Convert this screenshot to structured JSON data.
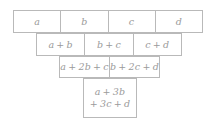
{
  "diagram": {
    "style": {
      "border_color": "#b9b9b9",
      "text_color": "#9a9a9a",
      "background_color": "#ffffff"
    },
    "rows": [
      {
        "name": "row-1-variables",
        "cells": [
          {
            "label": "a"
          },
          {
            "label": "b"
          },
          {
            "label": "c"
          },
          {
            "label": "d"
          }
        ]
      },
      {
        "name": "row-2-pair-sums",
        "cells": [
          {
            "label": "a + b"
          },
          {
            "label": "b + c"
          },
          {
            "label": "c + d"
          }
        ]
      },
      {
        "name": "row-3-triple-sums",
        "cells": [
          {
            "label": "a + 2b + c"
          },
          {
            "label": "b + 2c + d"
          }
        ]
      },
      {
        "name": "row-4-total",
        "cells": [
          {
            "line1": "a + 3b",
            "line2": "+ 3c + d"
          }
        ]
      }
    ]
  }
}
